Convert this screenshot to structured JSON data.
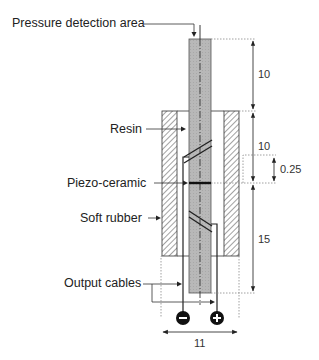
{
  "diagram": {
    "type": "technical cross-section",
    "labels": {
      "pressure_area": "Pressure detection area",
      "resin": "Resin",
      "piezo": "Piezo-ceramic",
      "soft_rubber": "Soft rubber",
      "output_cables": "Output cables"
    },
    "dimensions": {
      "top_length": "10",
      "middle_length": "10",
      "piezo_offset": "0.25",
      "bottom_length": "15",
      "width": "11"
    },
    "terminals": {
      "negative": "−",
      "positive": "+"
    },
    "colors": {
      "rod_fill": "#b4b4b4",
      "line": "#222222",
      "dotted": "#888888",
      "terminal": "#111111"
    }
  }
}
